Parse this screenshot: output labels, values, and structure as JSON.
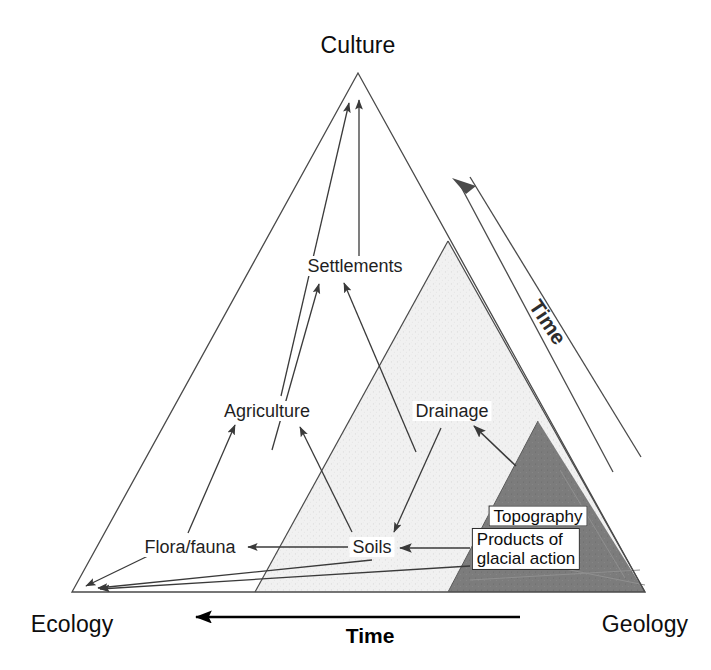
{
  "diagram": {
    "title_visible": false,
    "type": "conceptual-triangle-diagram",
    "corners": [
      {
        "id": "culture",
        "label": "Culture",
        "x": 358,
        "y": 45
      },
      {
        "id": "ecology",
        "label": "Ecology",
        "x": 72,
        "y": 622
      },
      {
        "id": "geology",
        "label": "Geology",
        "x": 645,
        "y": 622
      }
    ],
    "nodes": [
      {
        "id": "settlements",
        "label": "Settlements",
        "x": 355,
        "y": 266
      },
      {
        "id": "agriculture",
        "label": "Agriculture",
        "x": 267,
        "y": 411
      },
      {
        "id": "drainage",
        "label": "Drainage",
        "x": 452,
        "y": 411
      },
      {
        "id": "flora-fauna",
        "label": "Flora/fauna",
        "x": 190,
        "y": 547
      },
      {
        "id": "soils",
        "label": "Soils",
        "x": 372,
        "y": 547
      }
    ],
    "boxed_nodes": [
      {
        "id": "topography",
        "label": "Topography",
        "x": 538,
        "y": 516
      },
      {
        "id": "products-glacial-action",
        "label": "Products of\nglacial action",
        "x": 526,
        "y": 547
      }
    ],
    "axes": [
      {
        "id": "time-bottom",
        "label": "Time",
        "direction": "right-to-left",
        "x": 370,
        "y": 634
      },
      {
        "id": "time-diagonal",
        "label": "Time",
        "direction": "lower-right-to-upper-left",
        "x": 548,
        "y": 322,
        "rotation_deg": 56
      }
    ],
    "regions": [
      {
        "id": "outer-triangle",
        "fill": "#ffffff",
        "stroke": "#4a4a4a"
      },
      {
        "id": "light-shaded-triangle",
        "fill": "#f0f0f0"
      },
      {
        "id": "dark-shaded-triangle",
        "fill": "#7a7a7a"
      }
    ],
    "colors": {
      "stroke": "#4a4a4a",
      "arrow": "#3a3a3a",
      "light_fill": "#f0f0f0",
      "dark_fill": "#7c7c7c",
      "text": "#1a1a1a",
      "background": "#ffffff"
    }
  }
}
